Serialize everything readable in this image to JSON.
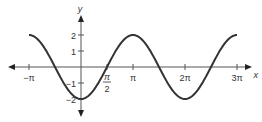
{
  "chart_data": {
    "type": "line",
    "title": "",
    "xlabel": "x",
    "ylabel": "y",
    "function": "y = -2cos(x)",
    "series": [
      {
        "name": "y = -2cos x",
        "x": [
          -3.1416,
          -2.3562,
          -1.5708,
          -0.7854,
          0,
          0.7854,
          1.5708,
          2.3562,
          3.1416,
          3.927,
          4.7124,
          5.4978,
          6.2832,
          7.0686,
          7.854,
          8.6394,
          9.4248
        ],
        "values": [
          2,
          1.414,
          0,
          -1.414,
          -2,
          -1.414,
          0,
          1.414,
          2,
          1.414,
          0,
          -1.414,
          -2,
          -1.414,
          0,
          1.414,
          2
        ]
      }
    ],
    "x_ticks": [
      {
        "value": -3.1416,
        "label": "−π"
      },
      {
        "value": 1.5708,
        "label": "π/2"
      },
      {
        "value": 3.1416,
        "label": "π"
      },
      {
        "value": 6.2832,
        "label": "2π"
      },
      {
        "value": 9.4248,
        "label": "3π"
      }
    ],
    "y_ticks": [
      {
        "value": 2,
        "label": "2"
      },
      {
        "value": 1,
        "label": "1"
      },
      {
        "value": -1,
        "label": "−1"
      },
      {
        "value": -2,
        "label": "−2"
      }
    ],
    "xlim": [
      -3.6,
      10.2
    ],
    "ylim": [
      -2.6,
      2.6
    ],
    "grid": false,
    "legend": "none"
  },
  "layout": {
    "origin_px": [
      81,
      67
    ],
    "px_per_pi": 52,
    "px_per_unit_y": 16,
    "axis_color": "#555555",
    "curve_color": "#333333"
  }
}
